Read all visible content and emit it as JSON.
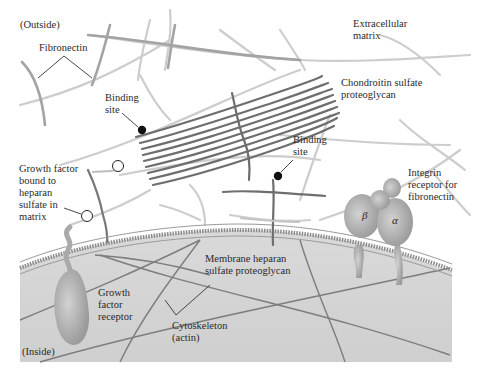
{
  "diagram": {
    "labels": {
      "outside": "(Outside)",
      "inside": "(Inside)",
      "fibronectin": "Fibronectin",
      "extracellular_matrix": "Extracellular\nmatrix",
      "chondroitin": "Chondroitin sulfate\nproteoglycan",
      "binding_site_1": "Binding\nsite",
      "binding_site_2": "Binding\nsite",
      "growth_factor_bound": "Growth factor\nbound to\nheparan\nsulfate in\nmatrix",
      "integrin_receptor": "Integrin\nreceptor for\nfibronectin",
      "beta": "β",
      "alpha": "α",
      "membrane_heparan": "Membrane heparan\nsulfate proteoglycan",
      "growth_factor_receptor": "Growth\nfactor\nreceptor",
      "cytoskeleton": "Cytoskeleton\n(actin)"
    },
    "colors": {
      "background": "#ffffff",
      "matrix_fiber": "#c8c8c8",
      "fibronectin": "#a0a0a0",
      "proteoglycan": "#6e6e6e",
      "cell_interior": "#d6d6d6",
      "membrane": "#8c8c8c",
      "protein": "#a9a9a9",
      "binding_dot": "#111111",
      "actin": "#7a7a7a"
    }
  }
}
